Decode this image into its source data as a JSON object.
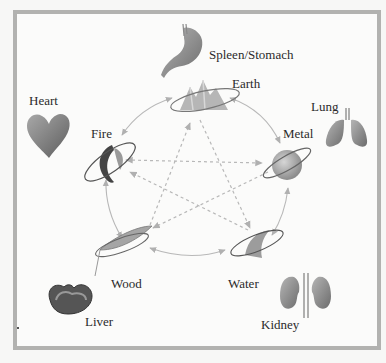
{
  "diagram": {
    "elements": [
      {
        "id": "earth",
        "label": "Earth",
        "organ": "Spleen/Stomach",
        "icon": "mountain-icon"
      },
      {
        "id": "metal",
        "label": "Metal",
        "organ": "Lung",
        "icon": "sphere-icon"
      },
      {
        "id": "water",
        "label": "Water",
        "organ": "Kidney",
        "icon": "wave-icon"
      },
      {
        "id": "wood",
        "label": "Wood",
        "organ": "Liver",
        "icon": "leaf-icon"
      },
      {
        "id": "fire",
        "label": "Fire",
        "organ": "Heart",
        "icon": "flame-icon"
      }
    ],
    "labels": {
      "earth": "Earth",
      "metal": "Metal",
      "water": "Water",
      "wood": "Wood",
      "fire": "Fire",
      "spleen_stomach": "Spleen/Stomach",
      "lung": "Lung",
      "kidney": "Kidney",
      "liver": "Liver",
      "heart": "Heart"
    },
    "generating_cycle": [
      "Fire",
      "Earth",
      "Metal",
      "Water",
      "Wood",
      "Fire"
    ],
    "controlling_cycle": [
      "Fire→Metal",
      "Metal→Wood",
      "Wood→Earth",
      "Earth→Water",
      "Water→Fire"
    ],
    "colors": {
      "frame": "#b2b2b0",
      "background": "#fbfbfa",
      "arrow": "#b8b8b8",
      "text": "#2a2a2a"
    }
  }
}
